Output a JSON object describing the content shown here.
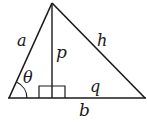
{
  "diagram": {
    "colors": {
      "stroke": "#1a1a1a",
      "background": "#ffffff"
    },
    "vertices": {
      "apex": [
        52,
        3
      ],
      "left": [
        9,
        98
      ],
      "right": [
        145,
        98
      ],
      "foot": [
        52,
        98
      ]
    },
    "labels": {
      "a": "a",
      "p": "p",
      "h": "h",
      "theta": "θ",
      "q": "q",
      "b": "b"
    },
    "markers": {
      "right_angle": "right-angle-square at altitude foot",
      "angle_arc": "arc at left vertex marking θ"
    }
  }
}
